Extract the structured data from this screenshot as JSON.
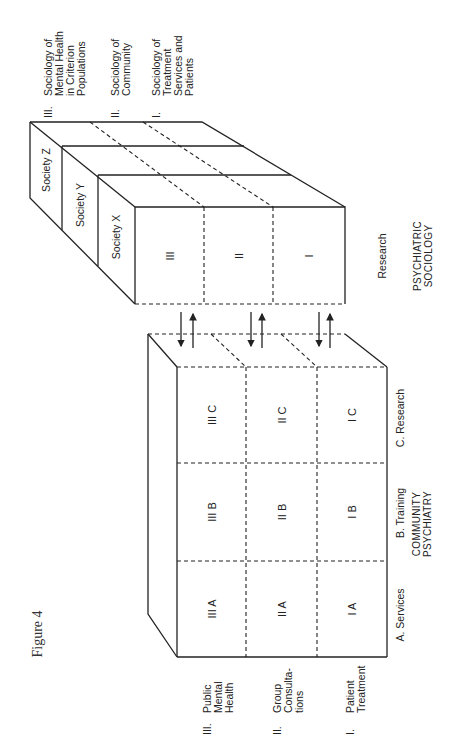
{
  "figure_title": "Figure 4",
  "psychiatric_sociology": {
    "title_line1": "PSYCHIATRIC",
    "title_line2": "SOCIOLOGY",
    "axis_label": "Research",
    "levels": [
      {
        "numeral": "III.",
        "lines": [
          "Sociology of",
          "Mental Health",
          "in Criterion",
          "Populations"
        ]
      },
      {
        "numeral": "II.",
        "lines": [
          "Sociology of",
          "Community"
        ]
      },
      {
        "numeral": "I.",
        "lines": [
          "Sociology of",
          "Treatment",
          "Services and",
          "Patients"
        ]
      }
    ],
    "societies": [
      "Society Z",
      "Society Y",
      "Society X"
    ],
    "front_cells": [
      "III",
      "II",
      "I"
    ]
  },
  "community_psychiatry": {
    "title_line1": "COMMUNITY",
    "title_line2": "PSYCHIATRY",
    "columns": [
      "A.  Services",
      "B.  Training",
      "C.  Research"
    ],
    "rows": [
      {
        "numeral": "III.",
        "lines": [
          "Public",
          "Mental",
          "Health"
        ]
      },
      {
        "numeral": "II.",
        "lines": [
          "Group",
          "Consulta-",
          "tions"
        ]
      },
      {
        "numeral": "I.",
        "lines": [
          "Patient",
          "Treatment"
        ]
      }
    ],
    "cells": {
      "III_C": "III  C",
      "II_C": "II  C",
      "I_C": "I  C",
      "III_B": "III  B",
      "II_B": "II  B",
      "I_B": "I  B",
      "III_A": "III  A",
      "II_A": "II  A",
      "I_A": "I  A"
    }
  }
}
